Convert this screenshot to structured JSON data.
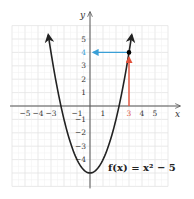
{
  "chart_data": {
    "type": "line",
    "title": "",
    "xlabel": "x",
    "ylabel": "y",
    "xlim": [
      -6,
      6
    ],
    "ylim": [
      -6,
      7
    ],
    "grid": true,
    "x_ticks": [
      "−5",
      "−4",
      "−3",
      "−1",
      "1",
      "3",
      "4",
      "5"
    ],
    "y_ticks": [
      "5",
      "4",
      "3",
      "2",
      "1",
      "−1",
      "−2",
      "−3",
      "−4"
    ],
    "series": [
      {
        "name": "f(x) = x² − 5",
        "function": "x^2 - 5",
        "x": [
          -3.3,
          -3,
          -2,
          -1,
          0,
          1,
          2,
          3,
          3.3
        ],
        "y": [
          5.89,
          4,
          -1,
          -4,
          -5,
          -4,
          -1,
          4,
          5.89
        ],
        "color": "#222222"
      }
    ],
    "annotations": [
      {
        "type": "point",
        "x": 3,
        "y": 4,
        "color": "#000000"
      },
      {
        "type": "arrow",
        "from": [
          3,
          0
        ],
        "to": [
          3,
          4
        ],
        "color": "#e0503a",
        "label": "input x = 3"
      },
      {
        "type": "arrow",
        "from": [
          3,
          4
        ],
        "to": [
          0,
          4
        ],
        "color": "#3a9fd6",
        "label": "output y = 4"
      },
      {
        "type": "label",
        "text": "f(x) = x² − 5",
        "x": 1.5,
        "y": -4.3
      }
    ],
    "highlighted_ticks": {
      "x": "3",
      "y": "4"
    }
  },
  "labels": {
    "x_axis": "x",
    "y_axis": "y",
    "function": "f(x) = x² − 5",
    "x_ticks": [
      {
        "text": "−5",
        "value": -5
      },
      {
        "text": "−4",
        "value": -4
      },
      {
        "text": "−3",
        "value": -3
      },
      {
        "text": "−1",
        "value": -1
      },
      {
        "text": "1",
        "value": 1
      },
      {
        "text": "3",
        "value": 3
      },
      {
        "text": "4",
        "value": 4
      },
      {
        "text": "5",
        "value": 5
      }
    ],
    "y_ticks": [
      {
        "text": "5",
        "value": 5
      },
      {
        "text": "4",
        "value": 4
      },
      {
        "text": "3",
        "value": 3
      },
      {
        "text": "2",
        "value": 2
      },
      {
        "text": "1",
        "value": 1
      },
      {
        "text": "−1",
        "value": -1
      },
      {
        "text": "−2",
        "value": -2
      },
      {
        "text": "−3",
        "value": -3
      },
      {
        "text": "−4",
        "value": -4
      }
    ]
  },
  "colors": {
    "grid": "#e3e3e3",
    "axis": "#555555",
    "curve": "#222222",
    "input_arrow": "#e0503a",
    "output_arrow": "#3a9fd6"
  }
}
